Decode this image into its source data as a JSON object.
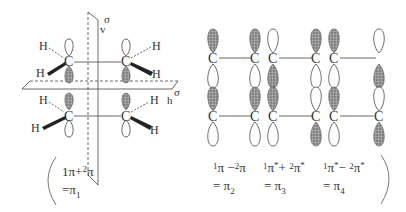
{
  "diagram": {
    "left_panel": {
      "title": "ethylene dimer with symmetry planes",
      "atoms": {
        "carbon": "C",
        "hydrogen": "H"
      },
      "symmetry_planes": [
        {
          "symbol": "σ",
          "subscript": "v",
          "label": "σv"
        },
        {
          "symbol": "σ",
          "subscript": "h",
          "label": "σh"
        }
      ],
      "combination": {
        "line1_a": "1",
        "line1_b": "π",
        "line1_op": "+",
        "line1_c": "2",
        "line1_d": "π",
        "line2_eq": "=π",
        "line2_sub": "1",
        "text": "1π+2π =π1"
      }
    },
    "right_panel": {
      "orbitals": [
        {
          "id": "pi2",
          "line1": {
            "a": "1",
            "b": "π",
            "op": " −",
            "c": "2",
            "d": "π"
          },
          "line2": {
            "eq": "= π",
            "sub": "2"
          },
          "text": "1π − 2π = π2",
          "upper_row": {
            "left_carbon_top_lobe": "shaded",
            "right_carbon_top_lobe": "shaded"
          },
          "lower_row": {
            "left_carbon_top_lobe": "shaded",
            "right_carbon_top_lobe": "shaded"
          }
        },
        {
          "id": "pi3",
          "line1": {
            "a": "1",
            "b": "π",
            "star1": "*",
            "op": "+ ",
            "c": "2",
            "d": "π",
            "star2": "*"
          },
          "line2": {
            "eq": "= π",
            "sub": "3"
          },
          "text": "1π* + 2π* = π3",
          "upper_row": {
            "left_carbon_top_lobe": "open",
            "right_carbon_top_lobe": "shaded"
          },
          "lower_row": {
            "left_carbon_top_lobe": "shaded",
            "right_carbon_top_lobe": "open"
          }
        },
        {
          "id": "pi4",
          "line1": {
            "a": "1",
            "b": "π",
            "star1": "*",
            "op": "− ",
            "c": "2",
            "d": "π",
            "star2": "*"
          },
          "line2": {
            "eq": "= π",
            "sub": "4"
          },
          "text": "1π* − 2π* = π4",
          "upper_row": {
            "left_carbon_top_lobe": "shaded",
            "right_carbon_top_lobe": "open"
          },
          "lower_row": {
            "left_carbon_top_lobe": "shaded",
            "right_carbon_top_lobe": "open"
          }
        }
      ]
    },
    "colors": {
      "line": "#444444",
      "shaded_lobe": "#8a8a8a",
      "text": "#333333",
      "background": "#ffffff"
    }
  }
}
